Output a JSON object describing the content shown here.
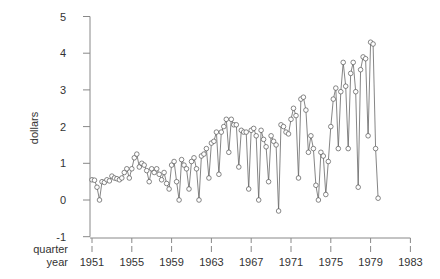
{
  "chart_data": {
    "type": "line",
    "title": "",
    "xlabel": "quarter / year",
    "ylabel": "dollars",
    "ylim": [
      -1,
      5
    ],
    "xlim": [
      1951,
      1983
    ],
    "grid": false,
    "legend": null,
    "x_axis_labels": {
      "row1": "quarter",
      "row2": "year"
    },
    "y_ticks": [
      -1,
      0,
      1,
      2,
      3,
      4,
      5
    ],
    "y_tick_labels": [
      "-1",
      "0",
      "1",
      "2",
      "3",
      "4",
      "5"
    ],
    "x_ticks": [
      1951,
      1955,
      1959,
      1963,
      1967,
      1971,
      1975,
      1979,
      1983
    ],
    "x_tick_labels": [
      "1951",
      "1955",
      "1959",
      "1963",
      "1967",
      "1971",
      "1975",
      "1979",
      "1983"
    ],
    "marker": "open-circle",
    "series": [
      {
        "name": "dollars",
        "start_year": 1951,
        "frequency": "quarterly",
        "values": [
          0.55,
          0.54,
          0.35,
          0.0,
          0.5,
          0.48,
          0.55,
          0.52,
          0.65,
          0.6,
          0.58,
          0.55,
          0.6,
          0.75,
          0.85,
          0.6,
          0.85,
          1.15,
          1.25,
          0.9,
          1.0,
          0.95,
          0.8,
          0.5,
          0.85,
          0.75,
          0.85,
          0.7,
          0.55,
          0.75,
          0.45,
          0.3,
          0.95,
          1.05,
          0.5,
          0.0,
          1.1,
          0.95,
          0.85,
          0.3,
          1.05,
          1.15,
          0.85,
          0.0,
          1.2,
          1.25,
          1.4,
          0.6,
          1.55,
          1.6,
          1.85,
          0.7,
          1.85,
          2.0,
          2.2,
          1.3,
          2.2,
          2.05,
          2.05,
          0.9,
          1.9,
          1.85,
          1.85,
          0.3,
          1.9,
          1.95,
          1.75,
          0.0,
          1.9,
          1.65,
          1.45,
          0.5,
          1.75,
          1.6,
          1.5,
          -0.3,
          2.05,
          2.0,
          1.85,
          1.8,
          2.2,
          2.5,
          2.3,
          0.6,
          2.75,
          2.8,
          2.45,
          1.3,
          1.75,
          1.4,
          0.4,
          0.0,
          1.3,
          1.2,
          0.15,
          1.05,
          2.0,
          2.75,
          3.05,
          1.4,
          2.95,
          3.75,
          3.1,
          1.4,
          3.45,
          3.75,
          2.95,
          0.35,
          3.55,
          3.9,
          3.85,
          1.75,
          4.3,
          4.25,
          1.4,
          0.05
        ]
      }
    ],
    "notable_points": [
      {
        "approx_year": 1970.9,
        "value": -0.45
      },
      {
        "approx_year": 1979.0,
        "value": 4.35
      }
    ]
  },
  "axes": {
    "ylabel": "dollars",
    "xlabel_row1": "quarter",
    "xlabel_row2": "year"
  }
}
